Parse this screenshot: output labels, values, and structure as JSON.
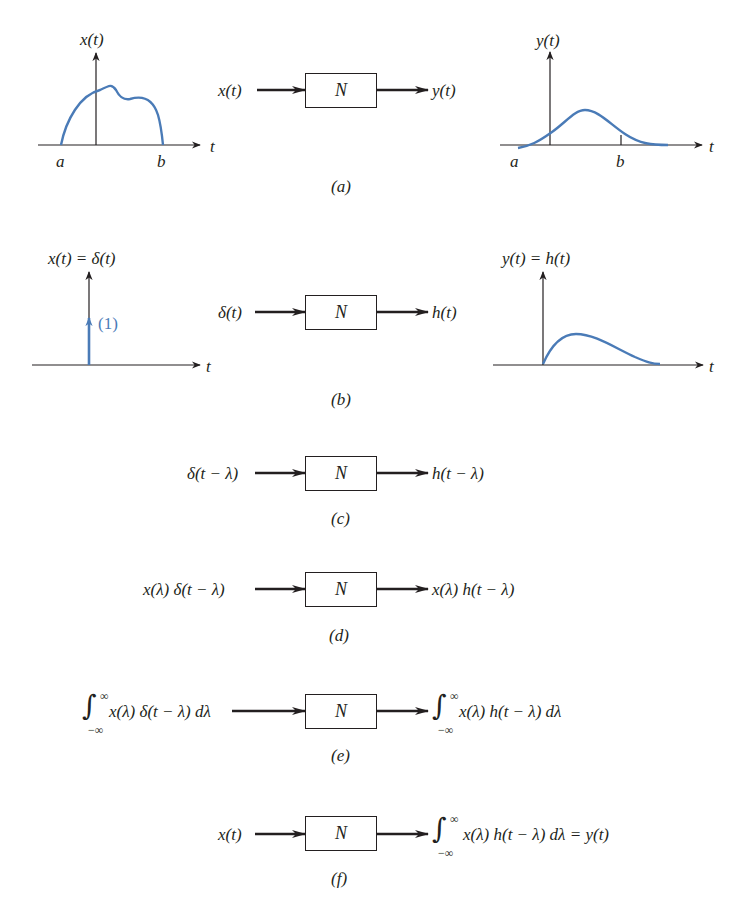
{
  "colors": {
    "ink": "#231f20",
    "signal_blue": "#4a7bb7",
    "background": "#ffffff"
  },
  "system_label": "N",
  "panels": {
    "a": {
      "caption": "(a)",
      "input_plot": {
        "ylabel": "x(t)",
        "xlabel": "t",
        "tick_a": "a",
        "tick_b": "b"
      },
      "output_plot": {
        "ylabel": "y(t)",
        "xlabel": "t",
        "tick_a": "a",
        "tick_b": "b"
      },
      "input": "x(t)",
      "output": "y(t)"
    },
    "b": {
      "caption": "(b)",
      "input_plot": {
        "ylabel": "x(t) = δ(t)",
        "xlabel": "t",
        "impulse_weight": "(1)"
      },
      "output_plot": {
        "ylabel": "y(t) = h(t)",
        "xlabel": "t"
      },
      "input": "δ(t)",
      "output": "h(t)"
    },
    "c": {
      "caption": "(c)",
      "input": "δ(t − λ)",
      "output": "h(t − λ)"
    },
    "d": {
      "caption": "(d)",
      "input": "x(λ) δ(t − λ)",
      "output": "x(λ) h(t − λ)"
    },
    "e": {
      "caption": "(e)",
      "input": {
        "integral": "∫",
        "upper": "∞",
        "lower": "−∞",
        "integrand": "x(λ)  δ(t − λ)  dλ"
      },
      "output": {
        "integral": "∫",
        "upper": "∞",
        "lower": "−∞",
        "integrand": "x(λ) h(t − λ) dλ"
      }
    },
    "f": {
      "caption": "(f)",
      "input": "x(t)",
      "output": {
        "integral": "∫",
        "upper": "∞",
        "lower": "−∞",
        "integrand": "x(λ) h(t − λ) dλ = y(t)"
      }
    }
  }
}
